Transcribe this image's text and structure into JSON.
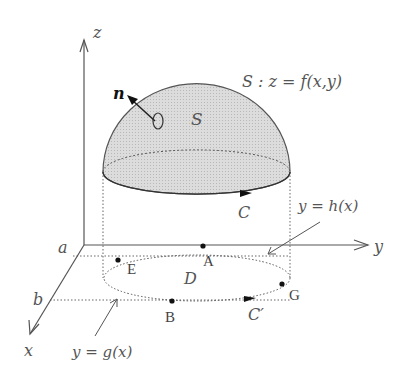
{
  "figure": {
    "axes": {
      "x_label": "x",
      "y_label": "y",
      "z_label": "z",
      "a_label": "a",
      "b_label": "b"
    },
    "surface": {
      "name": "S",
      "equation": "S : z = f(x,y)",
      "normal_label": "n",
      "boundary_label": "C",
      "fill_color": "#d4d4d4"
    },
    "region": {
      "name": "D",
      "boundary_label": "C′",
      "upper_curve": "y = h(x)",
      "lower_curve": "y = g(x)"
    },
    "points": [
      {
        "label": "A"
      },
      {
        "label": "B"
      },
      {
        "label": "E"
      },
      {
        "label": "G"
      }
    ],
    "colors": {
      "line": "#555555",
      "dark": "#222222",
      "text": "#555555"
    }
  }
}
